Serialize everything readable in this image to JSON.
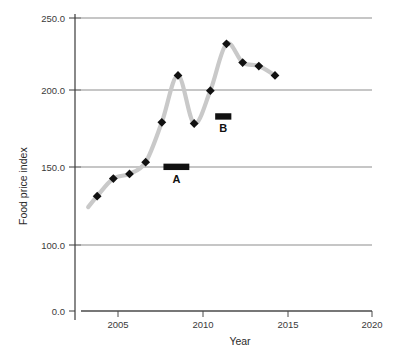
{
  "chart_data": {
    "type": "line",
    "title": "",
    "xlabel": "Year",
    "ylabel": "Food price index",
    "xlim": [
      2002,
      2020
    ],
    "ylim": [
      0,
      250
    ],
    "xticks": [
      "2005",
      "2010",
      "2015",
      "2020"
    ],
    "xtick_values": [
      2005,
      2010,
      2015,
      2020
    ],
    "yticks": [
      "0.0",
      "100.0",
      "150.0",
      "200.0",
      "250.0"
    ],
    "ytick_values": [
      0,
      100,
      150,
      200,
      250
    ],
    "grid": "horizontal",
    "legend": "none",
    "series": [
      {
        "name": "Food price index",
        "marker": "diamond",
        "marker_color": "#111111",
        "line_color": "#c9c9c9",
        "x": [
          2003,
          2004,
          2005,
          2006,
          2007,
          2008,
          2009,
          2010,
          2011,
          2012,
          2013,
          2014
        ],
        "values": [
          98,
          113,
          117,
          127,
          161,
          201,
          160,
          188,
          228,
          212,
          209,
          201
        ]
      }
    ],
    "annotations": [
      {
        "label": "A",
        "x_start": 2007.1,
        "x_end": 2008.7,
        "y": 123,
        "color": "#111111"
      },
      {
        "label": "B",
        "x_start": 2010.3,
        "x_end": 2011.3,
        "y": 166,
        "color": "#111111"
      }
    ]
  },
  "axis": {
    "y_title": "Food price index",
    "x_title": "Year"
  },
  "colors": {
    "line": "#c9c9c9",
    "marker": "#111111",
    "grid": "#8d8d8d",
    "axis": "#3a3a3a",
    "background": "#ffffff"
  }
}
